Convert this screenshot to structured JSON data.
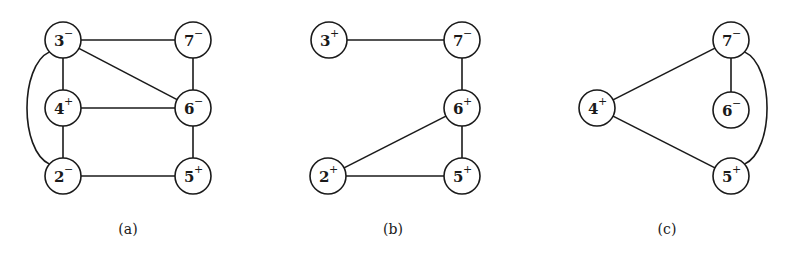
{
  "figure": {
    "panels": [
      {
        "id": "a",
        "caption": "(a)",
        "caption_pos": [
          128,
          234
        ],
        "nodes": [
          {
            "id": "3",
            "num": "3",
            "sign": "−",
            "x": 63,
            "y": 40
          },
          {
            "id": "7",
            "num": "7",
            "sign": "−",
            "x": 193,
            "y": 40
          },
          {
            "id": "4",
            "num": "4",
            "sign": "+",
            "x": 63,
            "y": 108
          },
          {
            "id": "6",
            "num": "6",
            "sign": "−",
            "x": 193,
            "y": 108
          },
          {
            "id": "2",
            "num": "2",
            "sign": "−",
            "x": 63,
            "y": 176
          },
          {
            "id": "5",
            "num": "5",
            "sign": "+",
            "x": 193,
            "y": 176
          }
        ],
        "edges": [
          {
            "from": "3",
            "to": "7"
          },
          {
            "from": "3",
            "to": "6"
          },
          {
            "from": "3",
            "to": "4"
          },
          {
            "from": "4",
            "to": "6"
          },
          {
            "from": "4",
            "to": "2"
          },
          {
            "from": "7",
            "to": "6"
          },
          {
            "from": "6",
            "to": "5"
          },
          {
            "from": "2",
            "to": "5"
          },
          {
            "from": "3",
            "to": "2",
            "curve": "left"
          }
        ]
      },
      {
        "id": "b",
        "caption": "(b)",
        "caption_pos": [
          393,
          234
        ],
        "nodes": [
          {
            "id": "3",
            "num": "3",
            "sign": "+",
            "x": 329,
            "y": 40
          },
          {
            "id": "7",
            "num": "7",
            "sign": "−",
            "x": 462,
            "y": 40
          },
          {
            "id": "6",
            "num": "6",
            "sign": "+",
            "x": 462,
            "y": 108
          },
          {
            "id": "2",
            "num": "2",
            "sign": "+",
            "x": 328,
            "y": 176
          },
          {
            "id": "5",
            "num": "5",
            "sign": "+",
            "x": 462,
            "y": 176
          }
        ],
        "edges": [
          {
            "from": "3",
            "to": "7"
          },
          {
            "from": "7",
            "to": "6"
          },
          {
            "from": "6",
            "to": "5"
          },
          {
            "from": "2",
            "to": "6"
          },
          {
            "from": "2",
            "to": "5"
          }
        ]
      },
      {
        "id": "c",
        "caption": "(c)",
        "caption_pos": [
          667,
          234
        ],
        "nodes": [
          {
            "id": "4",
            "num": "4",
            "sign": "+",
            "x": 597,
            "y": 108
          },
          {
            "id": "7",
            "num": "7",
            "sign": "−",
            "x": 731,
            "y": 40
          },
          {
            "id": "6",
            "num": "6",
            "sign": "−",
            "x": 731,
            "y": 110
          },
          {
            "id": "5",
            "num": "5",
            "sign": "+",
            "x": 731,
            "y": 176
          }
        ],
        "edges": [
          {
            "from": "4",
            "to": "7"
          },
          {
            "from": "4",
            "to": "5"
          },
          {
            "from": "7",
            "to": "6"
          },
          {
            "from": "7",
            "to": "5",
            "curve": "right"
          }
        ]
      }
    ],
    "node_radius": 18
  }
}
